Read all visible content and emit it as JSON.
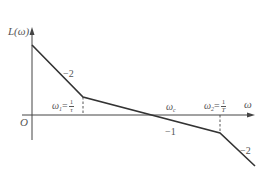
{
  "diagram": {
    "type": "bode-asymptotic-magnitude-plot",
    "y_axis_label": "L(ω)",
    "x_axis_label": "ω",
    "origin_label": "O",
    "segments": [
      {
        "slope_label": "−2",
        "from": "start",
        "to": "ω1"
      },
      {
        "slope_label": "−1",
        "from": "ω1",
        "to": "ω2"
      },
      {
        "slope_label": "−2",
        "from": "ω2",
        "to": "end"
      }
    ],
    "break_points": [
      {
        "symbol": "ω",
        "sub": "1",
        "eq": "=",
        "num": "1",
        "den": "τ"
      },
      {
        "symbol": "ω",
        "sub": "2",
        "eq": "=",
        "num": "1",
        "den": "T"
      }
    ],
    "crossover_label": {
      "symbol": "ω",
      "sub": "c"
    },
    "colors": {
      "line": "#333333",
      "text": "#555555"
    }
  }
}
